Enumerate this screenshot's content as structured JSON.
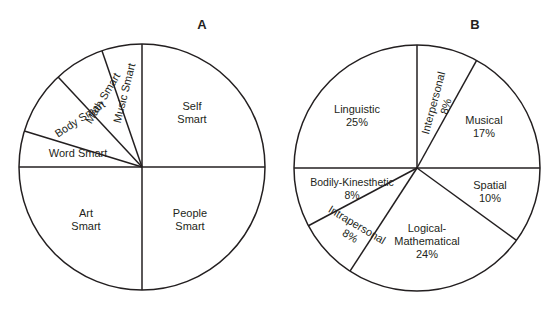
{
  "figure": {
    "background_color": "#ffffff",
    "line_color": "#231f20"
  },
  "panels": [
    {
      "letter": "A",
      "letter_x": 202,
      "letter_y": 29,
      "center_x": 142,
      "center_y": 167,
      "radius": 123
    },
    {
      "letter": "B",
      "letter_x": 475,
      "letter_y": 29,
      "center_x": 417,
      "center_y": 168,
      "radius": 123
    }
  ],
  "chart_data": [
    {
      "type": "pie",
      "title": "A",
      "panel": "A",
      "labels_show_percent": false,
      "categories": [
        "Self Smart",
        "People Smart",
        "Art Smart",
        "Word Smart",
        "Body Smart",
        "Math Smart",
        "Music Smart"
      ],
      "values": [
        25,
        25,
        25,
        8,
        8,
        6,
        3
      ],
      "slices": [
        {
          "label": "Self Smart",
          "label_line1": "Self",
          "label_line2": "Smart",
          "start_angle_deg": 0,
          "end_angle_deg": 90,
          "label_x": 192,
          "label_y": 110,
          "rotation_deg": 0,
          "anchor": "middle"
        },
        {
          "label": "People Smart",
          "label_line1": "People",
          "label_line2": "Smart",
          "start_angle_deg": 270,
          "end_angle_deg": 360,
          "label_x": 190,
          "label_y": 217,
          "rotation_deg": 0,
          "anchor": "middle"
        },
        {
          "label": "Art Smart",
          "label_line1": "Art",
          "label_line2": "Smart",
          "start_angle_deg": 180,
          "end_angle_deg": 270,
          "label_x": 86,
          "label_y": 217,
          "rotation_deg": 0,
          "anchor": "middle"
        },
        {
          "label": "Word Smart",
          "label_line1": "Word Smart",
          "label_line2": "",
          "start_angle_deg": 163,
          "end_angle_deg": 180,
          "label_x": 78,
          "label_y": 157,
          "rotation_deg": 0,
          "anchor": "middle"
        },
        {
          "label": "Body Smart",
          "label_line1": "Body Smart",
          "label_line2": "",
          "start_angle_deg": 133,
          "end_angle_deg": 163,
          "label_x": 82,
          "label_y": 122,
          "rotation_deg": -33,
          "anchor": "middle"
        },
        {
          "label": "Math Smart",
          "label_line1": "Math Smart",
          "label_line2": "",
          "start_angle_deg": 109,
          "end_angle_deg": 133,
          "label_x": 106,
          "label_y": 100,
          "rotation_deg": -59,
          "anchor": "middle"
        },
        {
          "label": "Music Smart",
          "label_line1": "Music Smart",
          "label_line2": "",
          "start_angle_deg": 90,
          "end_angle_deg": 109,
          "label_x": 128,
          "label_y": 94,
          "rotation_deg": -76,
          "anchor": "middle"
        }
      ]
    },
    {
      "type": "pie",
      "title": "B",
      "panel": "B",
      "labels_show_percent": true,
      "categories": [
        "Linguistic",
        "Interpersonal",
        "Musical",
        "Spatial",
        "Logical-Mathematical",
        "Intrapersonal",
        "Bodily-Kinesthetic"
      ],
      "values": [
        25,
        8,
        17,
        10,
        24,
        8,
        8
      ],
      "slices": [
        {
          "label": "Linguistic",
          "label_line1": "Linguistic",
          "label_line2": "25%",
          "percent": "25%",
          "start_angle_deg": 90,
          "end_angle_deg": 180,
          "label_x": 357,
          "label_y": 113,
          "rotation_deg": 0,
          "anchor": "middle"
        },
        {
          "label": "Interpersonal",
          "label_line1": "Interpersonal",
          "label_line2": "8%",
          "percent": "8%",
          "start_angle_deg": 61,
          "end_angle_deg": 90,
          "label_x": 437,
          "label_y": 104,
          "rotation_deg": -75,
          "anchor": "middle"
        },
        {
          "label": "Musical",
          "label_line1": "Musical",
          "label_line2": "17%",
          "percent": "17%",
          "start_angle_deg": 0,
          "end_angle_deg": 61,
          "label_x": 484,
          "label_y": 124,
          "rotation_deg": 0,
          "anchor": "middle"
        },
        {
          "label": "Spatial",
          "label_line1": "Spatial",
          "label_line2": "10%",
          "percent": "10%",
          "start_angle_deg": 324,
          "end_angle_deg": 360,
          "label_x": 490,
          "label_y": 189,
          "rotation_deg": 0,
          "anchor": "middle"
        },
        {
          "label": "Logical-Mathematical",
          "label_line1": "Logical-",
          "label_line2": "Mathematical",
          "label_line3": "24%",
          "percent": "24%",
          "start_angle_deg": 237,
          "end_angle_deg": 324,
          "label_x": 427,
          "label_y": 232,
          "rotation_deg": 0,
          "anchor": "middle"
        },
        {
          "label": "Intrapersonal",
          "label_line1": "Intrapersonal",
          "label_line2": "8%",
          "percent": "8%",
          "start_angle_deg": 208,
          "end_angle_deg": 237,
          "label_x": 355,
          "label_y": 228,
          "rotation_deg": 31,
          "anchor": "middle"
        },
        {
          "label": "Bodily-Kinesthetic",
          "label_line1": "Bodily-Kinesthetic",
          "label_line2": "8%",
          "percent": "8%",
          "start_angle_deg": 180,
          "end_angle_deg": 208,
          "label_x": 352,
          "label_y": 186,
          "rotation_deg": 0,
          "anchor": "middle"
        }
      ]
    }
  ]
}
